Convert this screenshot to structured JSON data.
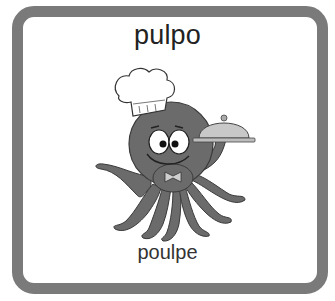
{
  "card": {
    "word_primary": "pulpo",
    "word_secondary": "poulpe",
    "illustration": {
      "subject": "octopus-chef-icon",
      "description": "cartoon octopus wearing a chef hat holding a serving cloche"
    },
    "colors": {
      "border": "#7a7a7a",
      "background": "#ffffff",
      "octopus_body": "#6a6a6a",
      "text": "#222222"
    }
  }
}
